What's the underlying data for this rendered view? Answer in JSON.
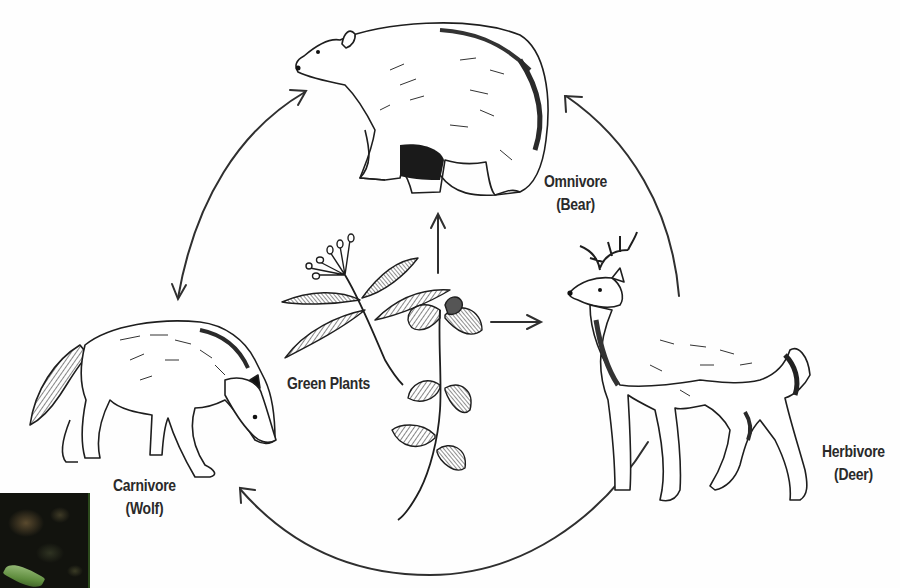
{
  "diagram": {
    "type": "food-web",
    "nodes": [
      {
        "id": "bear",
        "name": "Omnivore",
        "example": "(Bear)"
      },
      {
        "id": "deer",
        "name": "Herbivore",
        "example": "(Deer)"
      },
      {
        "id": "wolf",
        "name": "Carnivore",
        "example": "(Wolf)"
      },
      {
        "id": "plants",
        "name": "Green Plants"
      }
    ],
    "edges": [
      {
        "from": "plants",
        "to": "bear",
        "style": "straight"
      },
      {
        "from": "plants",
        "to": "deer",
        "style": "straight"
      },
      {
        "from": "deer",
        "to": "bear",
        "style": "arc"
      },
      {
        "from": "deer",
        "to": "wolf",
        "style": "arc"
      },
      {
        "from": "wolf",
        "to": "bear",
        "style": "arc",
        "bidirectional": true
      }
    ]
  },
  "labels": {
    "omnivore": {
      "line1": "Omnivore",
      "line2": "(Bear)"
    },
    "herbivore": {
      "line1": "Herbivore",
      "line2": "(Deer)"
    },
    "carnivore": {
      "line1": "Carnivore",
      "line2": "(Wolf)"
    },
    "plants": {
      "line1": "Green Plants"
    }
  },
  "colors": {
    "ink": "#2a2a2a",
    "background": "#fefefe"
  }
}
